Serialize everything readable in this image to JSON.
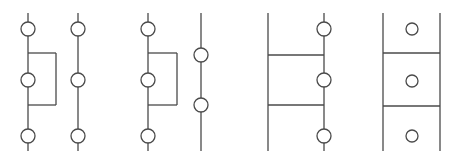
{
  "figure": {
    "canvas": {
      "width": 459,
      "height": 165,
      "background": "#ffffff"
    },
    "stroke": {
      "color": "#4a4a4a",
      "width": 1.3,
      "circle_width": 1.3
    },
    "groups": [
      {
        "id": "group-1",
        "name": "group-1-rectangle-left-rail",
        "rails": [
          {
            "id": "g1-rail-left",
            "x": 28,
            "y1": 13,
            "y2": 151
          },
          {
            "id": "g1-rail-right",
            "x": 78,
            "y1": 13,
            "y2": 151
          }
        ],
        "rungs": [],
        "rectangles": [
          {
            "id": "g1-rect",
            "x1": 28,
            "y1": 53,
            "x2": 56,
            "y2": 105
          }
        ],
        "circles": [
          {
            "id": "g1-c1",
            "cx": 28,
            "cy": 29,
            "r": 7
          },
          {
            "id": "g1-c2",
            "cx": 28,
            "cy": 80,
            "r": 7
          },
          {
            "id": "g1-c3",
            "cx": 28,
            "cy": 136,
            "r": 7
          },
          {
            "id": "g1-c4",
            "cx": 78,
            "cy": 29,
            "r": 7
          },
          {
            "id": "g1-c5",
            "cx": 78,
            "cy": 80,
            "r": 7
          },
          {
            "id": "g1-c6",
            "cx": 78,
            "cy": 136,
            "r": 7
          }
        ]
      },
      {
        "id": "group-2",
        "name": "group-2-rectangle-offset-right-rail",
        "rails": [
          {
            "id": "g2-rail-left",
            "x": 148,
            "y1": 13,
            "y2": 151
          },
          {
            "id": "g2-rail-right",
            "x": 201,
            "y1": 13,
            "y2": 151
          }
        ],
        "rungs": [],
        "rectangles": [
          {
            "id": "g2-rect",
            "x1": 148,
            "y1": 53,
            "x2": 177,
            "y2": 105
          }
        ],
        "circles": [
          {
            "id": "g2-c1",
            "cx": 148,
            "cy": 29,
            "r": 7
          },
          {
            "id": "g2-c2",
            "cx": 148,
            "cy": 80,
            "r": 7
          },
          {
            "id": "g2-c3",
            "cx": 148,
            "cy": 136,
            "r": 7
          },
          {
            "id": "g2-c4",
            "cx": 201,
            "cy": 55,
            "r": 7
          },
          {
            "id": "g2-c5",
            "cx": 201,
            "cy": 105,
            "r": 7
          }
        ]
      },
      {
        "id": "group-3",
        "name": "group-3-ladder-right-nodes",
        "rails": [
          {
            "id": "g3-rail-left",
            "x": 268,
            "y1": 13,
            "y2": 151
          },
          {
            "id": "g3-rail-right",
            "x": 324,
            "y1": 13,
            "y2": 151
          }
        ],
        "rungs": [
          {
            "id": "g3-rung-1",
            "x1": 268,
            "x2": 324,
            "y": 55
          },
          {
            "id": "g3-rung-2",
            "x1": 268,
            "x2": 324,
            "y": 105
          }
        ],
        "rectangles": [],
        "circles": [
          {
            "id": "g3-c1",
            "cx": 324,
            "cy": 29,
            "r": 7
          },
          {
            "id": "g3-c2",
            "cx": 324,
            "cy": 80,
            "r": 7
          },
          {
            "id": "g3-c3",
            "cx": 324,
            "cy": 136,
            "r": 7
          }
        ]
      },
      {
        "id": "group-4",
        "name": "group-4-ladder-center-nodes",
        "rails": [
          {
            "id": "g4-rail-left",
            "x": 383,
            "y1": 13,
            "y2": 151
          },
          {
            "id": "g4-rail-right",
            "x": 440,
            "y1": 13,
            "y2": 151
          }
        ],
        "rungs": [
          {
            "id": "g4-rung-1",
            "x1": 383,
            "x2": 440,
            "y": 53
          },
          {
            "id": "g4-rung-2",
            "x1": 383,
            "x2": 440,
            "y": 106
          }
        ],
        "rectangles": [],
        "circles": [
          {
            "id": "g4-c1",
            "cx": 412,
            "cy": 29,
            "r": 6
          },
          {
            "id": "g4-c2",
            "cx": 412,
            "cy": 81,
            "r": 6
          },
          {
            "id": "g4-c3",
            "cx": 412,
            "cy": 136,
            "r": 6
          }
        ]
      }
    ]
  }
}
